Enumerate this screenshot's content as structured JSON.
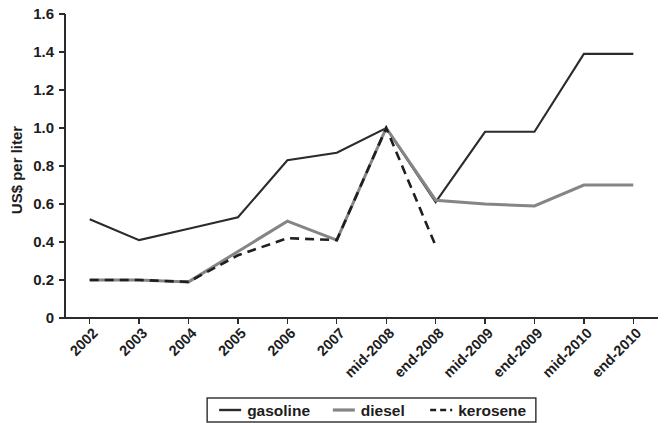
{
  "chart_data": {
    "type": "line",
    "title": "",
    "subtitle": "",
    "xlabel": "",
    "ylabel": "US$ per liter",
    "categories": [
      "2002",
      "2003",
      "2004",
      "2005",
      "2006",
      "2007",
      "mid-2008",
      "end-2008",
      "mid-2009",
      "end-2009",
      "mid-2010",
      "end-2010"
    ],
    "ylim": [
      0,
      1.6
    ],
    "ytick_labels": [
      "0",
      "0.2",
      "0.4",
      "0.6",
      "0.8",
      "1.0",
      "1.2",
      "1.4",
      "1.6"
    ],
    "ytick_values": [
      0,
      0.2,
      0.4,
      0.6,
      0.8,
      1.0,
      1.2,
      1.4,
      1.6
    ],
    "grid": false,
    "legend_position": "bottom",
    "series": [
      {
        "name": "gasoline",
        "color": "#2b2b2b",
        "style": "solid",
        "width": 2.1,
        "values": [
          0.52,
          0.41,
          0.47,
          0.53,
          0.83,
          0.87,
          1.0,
          0.61,
          0.98,
          0.98,
          1.39,
          1.39
        ]
      },
      {
        "name": "diesel",
        "color": "#858585",
        "style": "solid",
        "width": 3.0,
        "values": [
          0.2,
          0.2,
          0.19,
          0.35,
          0.51,
          0.41,
          1.0,
          0.62,
          0.6,
          0.59,
          0.7,
          0.7
        ]
      },
      {
        "name": "kerosene",
        "color": "#1f1f1f",
        "style": "dashed",
        "width": 2.6,
        "values": [
          0.2,
          0.2,
          0.19,
          0.33,
          0.42,
          0.41,
          1.0,
          0.38,
          null,
          null,
          null,
          null
        ]
      }
    ]
  },
  "legend": {
    "items": [
      {
        "label": "gasoline",
        "color": "#2b2b2b",
        "style": "solid"
      },
      {
        "label": "diesel",
        "color": "#858585",
        "style": "solid"
      },
      {
        "label": "kerosene",
        "color": "#1f1f1f",
        "style": "dashed"
      }
    ]
  }
}
